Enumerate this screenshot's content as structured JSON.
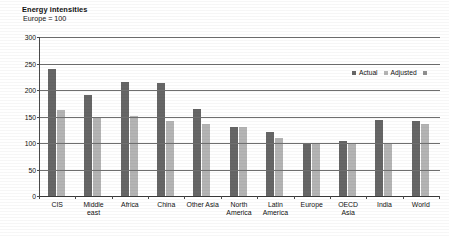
{
  "chart_data": {
    "type": "bar",
    "title": "Energy intensities",
    "subtitle": "Europe = 100",
    "xlabel": "",
    "ylabel": "",
    "ylim": [
      0,
      300
    ],
    "yticks": [
      0,
      50,
      100,
      150,
      200,
      250,
      300
    ],
    "grid": true,
    "legend_position": "top-right",
    "categories": [
      "CIS",
      "Middle\neast",
      "Africa",
      "China",
      "Other Asia",
      "North\nAmerica",
      "Latin\nAmerica",
      "Europe",
      "OECD\nAsia",
      "India",
      "World"
    ],
    "series": [
      {
        "name": "Actual",
        "color": "#666666",
        "values": [
          240,
          190,
          215,
          214,
          165,
          130,
          120,
          100,
          103,
          143,
          142
        ]
      },
      {
        "name": "Adjusted",
        "color": "#b4b4b4",
        "values": [
          163,
          150,
          151,
          141,
          135,
          130,
          110,
          100,
          100,
          100,
          135
        ]
      }
    ]
  },
  "legend": {
    "entries": [
      {
        "label": "Actual",
        "swatch": "legend-swatch-dark"
      },
      {
        "label": "Adjusted",
        "swatch": "legend-swatch-light"
      }
    ],
    "trailing_marker": "legend-swatch-extra"
  }
}
